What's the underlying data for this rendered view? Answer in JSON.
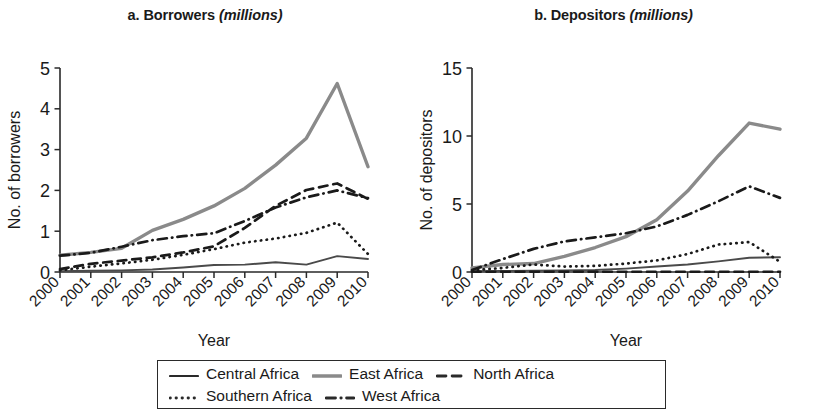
{
  "figure": {
    "panels": [
      {
        "key": "a",
        "title_prefix": "a. Borrowers ",
        "title_italic": "(millions)",
        "ylabel": "No. of borrowers",
        "xlabel": "Year"
      },
      {
        "key": "b",
        "title_prefix": "b. Depositors ",
        "title_italic": "(millions)",
        "ylabel": "No. of depositors",
        "xlabel": "Year"
      }
    ]
  },
  "legend": {
    "rows": [
      [
        {
          "label": "Central Africa",
          "style": "solid",
          "color": "#2a2a2a"
        },
        {
          "label": "East Africa",
          "style": "solid",
          "color": "#8a8a8a"
        },
        {
          "label": "North Africa",
          "style": "dashed",
          "color": "#2a2a2a"
        }
      ],
      [
        {
          "label": "Southern Africa",
          "style": "dotted",
          "color": "#2a2a2a"
        },
        {
          "label": "West Africa",
          "style": "dashdot",
          "color": "#2a2a2a"
        }
      ]
    ]
  },
  "chart_data": [
    {
      "type": "line",
      "panel": "a",
      "title": "a. Borrowers (millions)",
      "xlabel": "Year",
      "ylabel": "No. of borrowers",
      "x": [
        "2000",
        "2001",
        "2002",
        "2003",
        "2004",
        "2005",
        "2006",
        "2007",
        "2008",
        "2009",
        "2010"
      ],
      "xlim": [
        2000,
        2010
      ],
      "ylim": [
        0,
        5
      ],
      "yticks": [
        0,
        1,
        2,
        3,
        4,
        5
      ],
      "grid": false,
      "legend_position": "below",
      "series": [
        {
          "name": "Central Africa",
          "style": "solid",
          "color": "#4a4a4a",
          "values": [
            0.02,
            0.03,
            0.04,
            0.06,
            0.11,
            0.17,
            0.18,
            0.24,
            0.18,
            0.39,
            0.32
          ]
        },
        {
          "name": "East Africa",
          "style": "solid",
          "color": "#8a8a8a",
          "values": [
            0.41,
            0.48,
            0.58,
            1.02,
            1.29,
            1.62,
            2.05,
            2.62,
            3.28,
            4.62,
            2.58
          ]
        },
        {
          "name": "North Africa",
          "style": "dashed",
          "color": "#1a1a1a",
          "values": [
            0.07,
            0.2,
            0.28,
            0.36,
            0.48,
            0.63,
            1.08,
            1.62,
            2.01,
            2.17,
            1.79
          ]
        },
        {
          "name": "Southern Africa",
          "style": "dotted",
          "color": "#1a1a1a",
          "values": [
            0.04,
            0.13,
            0.21,
            0.3,
            0.42,
            0.56,
            0.72,
            0.82,
            0.96,
            1.21,
            0.44
          ]
        },
        {
          "name": "West Africa",
          "style": "dashdot",
          "color": "#1a1a1a",
          "values": [
            0.4,
            0.47,
            0.62,
            0.78,
            0.88,
            0.95,
            1.25,
            1.58,
            1.83,
            2.0,
            1.81
          ]
        }
      ]
    },
    {
      "type": "line",
      "panel": "b",
      "title": "b. Depositors (millions)",
      "xlabel": "Year",
      "ylabel": "No. of depositors",
      "x": [
        "2000",
        "2001",
        "2002",
        "2003",
        "2004",
        "2005",
        "2006",
        "2007",
        "2008",
        "2009",
        "2010"
      ],
      "xlim": [
        2000,
        2010
      ],
      "ylim": [
        0,
        15
      ],
      "yticks": [
        0,
        5,
        10,
        15
      ],
      "grid": false,
      "legend_position": "below",
      "series": [
        {
          "name": "Central Africa",
          "style": "solid",
          "color": "#4a4a4a",
          "values": [
            0.05,
            0.08,
            0.1,
            0.12,
            0.15,
            0.25,
            0.4,
            0.55,
            0.78,
            1.05,
            1.08
          ]
        },
        {
          "name": "East Africa",
          "style": "solid",
          "color": "#8a8a8a",
          "values": [
            0.3,
            0.55,
            0.62,
            1.15,
            1.8,
            2.6,
            3.85,
            5.95,
            8.55,
            10.95,
            10.5
          ]
        },
        {
          "name": "North Africa",
          "style": "dashed",
          "color": "#1a1a1a",
          "values": [
            0.02,
            0.02,
            0.02,
            0.02,
            0.02,
            0.02,
            0.02,
            0.02,
            0.02,
            0.02,
            0.02
          ]
        },
        {
          "name": "Southern Africa",
          "style": "dotted",
          "color": "#1a1a1a",
          "values": [
            0.12,
            0.3,
            0.55,
            0.4,
            0.45,
            0.62,
            0.85,
            1.32,
            2.02,
            2.2,
            0.75
          ]
        },
        {
          "name": "West Africa",
          "style": "dashdot",
          "color": "#1a1a1a",
          "values": [
            0.15,
            0.95,
            1.7,
            2.25,
            2.55,
            2.85,
            3.35,
            4.2,
            5.2,
            6.3,
            5.45
          ]
        }
      ]
    }
  ]
}
